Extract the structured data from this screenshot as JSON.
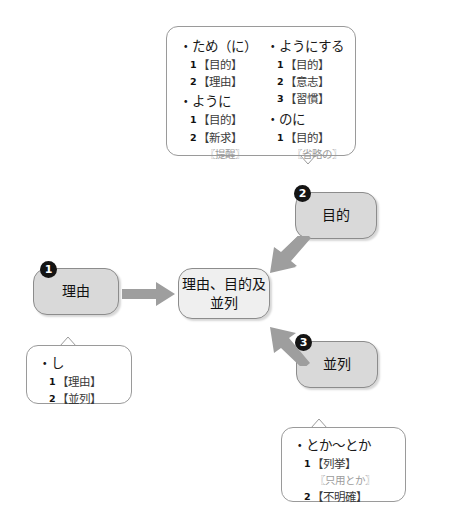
{
  "diagram": {
    "colors": {
      "node_fill": "#d9d9d9",
      "center_fill": "#efefef",
      "badge_fill": "#141414",
      "arrow_fill": "#9e9e9e",
      "border": "#9a9a9a",
      "note_text": "#9b9b9b"
    }
  },
  "center_node": {
    "line1": "理由、目的及",
    "line2": "並列"
  },
  "nodes": [
    {
      "badge": "❶",
      "label": "理由"
    },
    {
      "badge": "❷",
      "label": "目的"
    },
    {
      "badge": "❸",
      "label": "並列"
    }
  ],
  "purpose_callout": {
    "left_column": [
      {
        "type": "head",
        "text": "・ため（に）"
      },
      {
        "type": "sense",
        "num": "1",
        "text": "【目的】"
      },
      {
        "type": "sense",
        "num": "2",
        "text": "【理由】"
      },
      {
        "type": "head",
        "text": "・ように"
      },
      {
        "type": "sense",
        "num": "1",
        "text": "【目的】"
      },
      {
        "type": "sense",
        "num": "2",
        "text": "【新求】"
      },
      {
        "type": "note",
        "text": "〖提醒〗"
      }
    ],
    "right_column": [
      {
        "type": "head",
        "text": "・ようにする"
      },
      {
        "type": "sense",
        "num": "1",
        "text": "【目的】"
      },
      {
        "type": "sense",
        "num": "2",
        "text": "【意志】"
      },
      {
        "type": "sense",
        "num": "3",
        "text": "【習慣】"
      },
      {
        "type": "head",
        "text": "・のに"
      },
      {
        "type": "sense",
        "num": "1",
        "text": "【目的】"
      },
      {
        "type": "note",
        "text": "〖省略の〗"
      }
    ]
  },
  "reason_callout": {
    "items": [
      {
        "type": "head",
        "text": "・し"
      },
      {
        "type": "sense",
        "num": "1",
        "text": "【理由】"
      },
      {
        "type": "sense",
        "num": "2",
        "text": "【並列】"
      }
    ]
  },
  "parallel_callout": {
    "items": [
      {
        "type": "head",
        "text": "・とか〜とか"
      },
      {
        "type": "sense",
        "num": "1",
        "text": "【列挙】"
      },
      {
        "type": "note",
        "text": "〖只用とか〗"
      },
      {
        "type": "sense",
        "num": "2",
        "text": "【不明確】"
      }
    ]
  },
  "arrows": [
    {
      "name": "reason-to-center",
      "direction": "right"
    },
    {
      "name": "purpose-to-center",
      "direction": "down-left"
    },
    {
      "name": "parallel-to-center",
      "direction": "up-left"
    }
  ]
}
